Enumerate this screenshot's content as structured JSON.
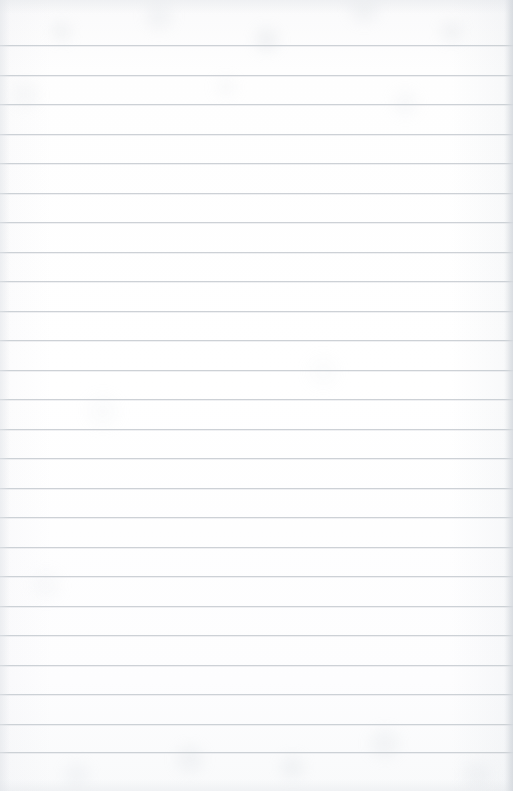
{
  "document": {
    "kind": "scanned-ruled-paper",
    "title": "Blank ruled notebook page",
    "page_width": 513,
    "page_height": 791,
    "content_text": "",
    "has_handwriting": false,
    "has_printed_text": false
  },
  "paper": {
    "background_color": "#fdfdfd",
    "base_tint_color": "#fafafb",
    "edge_shadow_color": "#d6dadf",
    "texture": "faint mottled scanner grain"
  },
  "ruling": {
    "line_color": "#c9ced3",
    "line_thickness_px": 1,
    "line_spacing_px": 29.5,
    "line_count": 25,
    "first_line_y": 45,
    "last_line_y": 752,
    "left_inset_px": 0,
    "right_inset_px": 0,
    "top_margin_px": 45,
    "bottom_margin_px": 39,
    "has_vertical_margin_rule": false,
    "line_positions_y": [
      45,
      74.5,
      104,
      133.5,
      163,
      192.5,
      222,
      251.5,
      281,
      310.5,
      340,
      369.5,
      399,
      428.5,
      458,
      487.5,
      517,
      546.5,
      576,
      605.5,
      635,
      664.5,
      694,
      723.5,
      752
    ]
  }
}
